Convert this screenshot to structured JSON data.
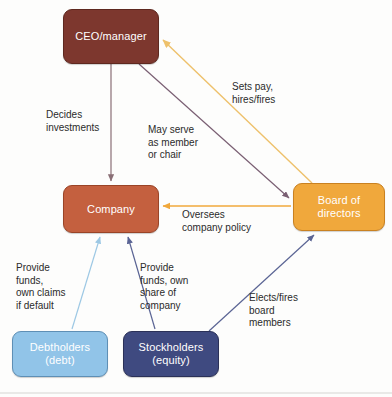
{
  "diagram": {
    "background_color": "#fdfdfc",
    "nodes": [
      {
        "id": "ceo",
        "label": "CEO/manager",
        "sublabel": "",
        "color": "#7d372e",
        "border_color": "#5e281f",
        "text_color": "#ffffff"
      },
      {
        "id": "company",
        "label": "Company",
        "sublabel": "",
        "color": "#c4603f",
        "border_color": "#9a4427",
        "text_color": "#ffffff"
      },
      {
        "id": "board",
        "label": "Board of",
        "sublabel": "directors",
        "color": "#f0a83c",
        "border_color": "#c98121",
        "text_color": "#ffffff"
      },
      {
        "id": "debtholders",
        "label": "Debtholders",
        "sublabel": "(debt)",
        "color": "#91c4e8",
        "border_color": "#5e8fb5",
        "text_color": "#ffffff"
      },
      {
        "id": "stockholders",
        "label": "Stockholders",
        "sublabel": "(equity)",
        "color": "#3f4a80",
        "border_color": "#2b3158",
        "text_color": "#ffffff"
      }
    ],
    "edges": [
      {
        "id": "decides-investments",
        "from": "ceo",
        "to": "company",
        "label": "Decides\ninvestments",
        "color": "#8a6f76"
      },
      {
        "id": "may-serve",
        "from": "ceo",
        "to": "board",
        "label": "May serve\nas member\nor chair",
        "color": "#7a5f73"
      },
      {
        "id": "sets-pay",
        "from": "board",
        "to": "ceo",
        "label": "Sets pay,\nhires/fires",
        "color": "#f0c36a"
      },
      {
        "id": "oversees-company-policy",
        "from": "board",
        "to": "company",
        "label": "Oversees\ncompany policy",
        "color": "#f0a83c"
      },
      {
        "id": "provide-funds-debt",
        "from": "debtholders",
        "to": "company",
        "label": "Provide\nfunds,\nown claims\nif default",
        "color": "#9dc8e4"
      },
      {
        "id": "provide-funds-equity",
        "from": "stockholders",
        "to": "company",
        "label": "Provide\nfunds, own\nshare of\ncompany",
        "color": "#5a6494"
      },
      {
        "id": "elects-fires-board",
        "from": "stockholders",
        "to": "board",
        "label": "Elects/fires\nboard\nmembers",
        "color": "#5a6494"
      }
    ]
  }
}
